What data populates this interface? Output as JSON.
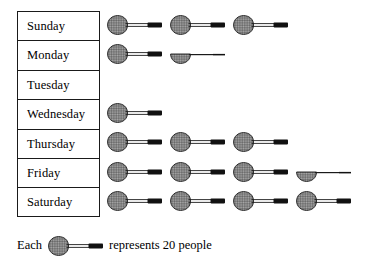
{
  "chart_data": {
    "type": "pictograph",
    "title": "",
    "xlabel": "",
    "ylabel": "",
    "unit_value": 20,
    "unit_icon": "tennis-racket-icon",
    "legend": {
      "prefix": "Each",
      "suffix": "represents 20 people"
    },
    "categories": [
      "Sunday",
      "Monday",
      "Tuesday",
      "Wednesday",
      "Thursday",
      "Friday",
      "Saturday"
    ],
    "icons": [
      3,
      1.5,
      0,
      1,
      3,
      3.5,
      4
    ],
    "values": [
      60,
      30,
      0,
      20,
      60,
      70,
      80
    ],
    "rows": [
      {
        "label": "Sunday",
        "icons": 3,
        "value": 60
      },
      {
        "label": "Monday",
        "icons": 1.5,
        "value": 30
      },
      {
        "label": "Tuesday",
        "icons": 0,
        "value": 0
      },
      {
        "label": "Wednesday",
        "icons": 1,
        "value": 20
      },
      {
        "label": "Thursday",
        "icons": 3,
        "value": 60
      },
      {
        "label": "Friday",
        "icons": 3.5,
        "value": 70
      },
      {
        "label": "Saturday",
        "icons": 4,
        "value": 80
      }
    ]
  },
  "colors": {
    "border": "#1a1a1a",
    "icon_fill": "#a8a8a8",
    "icon_stroke": "#1a1a1a",
    "grip": "#111111",
    "background": "#ffffff"
  }
}
